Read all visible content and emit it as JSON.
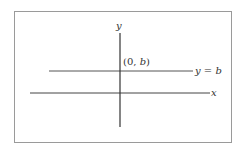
{
  "diagram": {
    "y_axis_label": "y",
    "x_axis_label": "x",
    "point_label_open": "(0, ",
    "point_label_var": "b",
    "point_label_close": ")",
    "line_label": "y = b",
    "colors": {
      "axis": "#333333",
      "line": "#444444",
      "border": "#9a9a9a"
    }
  }
}
